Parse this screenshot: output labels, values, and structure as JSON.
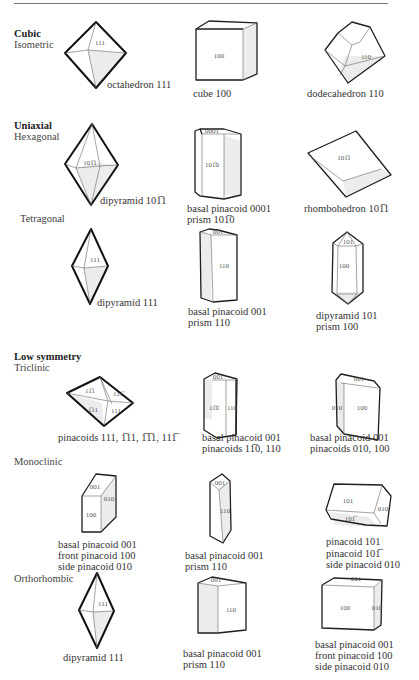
{
  "header": {
    "cut_title": ""
  },
  "sections": {
    "cubic": {
      "title": "Cubic",
      "subtitle": "Isometric",
      "forms": [
        {
          "face": "111",
          "caption": [
            "octahedron 111"
          ]
        },
        {
          "face": "100",
          "caption": [
            "cube 100"
          ]
        },
        {
          "face": "110",
          "caption": [
            "dodecahedron 110"
          ]
        }
      ]
    },
    "uniaxial": {
      "title": "Uniaxial",
      "hexagonal": {
        "subtitle": "Hexagonal",
        "forms": [
          {
            "face": "101̅1",
            "caption": [
              "dipyramid 101̅1"
            ]
          },
          {
            "faces": [
              "0001",
              "101̅0"
            ],
            "caption": [
              "basal pinacoid 0001",
              "prism 101̅0"
            ]
          },
          {
            "face": "101̅1",
            "caption": [
              "rhombohedron 101̅1"
            ]
          }
        ]
      },
      "tetragonal": {
        "subtitle": "Tetragonal",
        "forms": [
          {
            "face": "111",
            "caption": [
              "dipyramid 111"
            ]
          },
          {
            "faces": [
              "001",
              "110"
            ],
            "caption": [
              "basal pinacoid 001",
              "prism 110"
            ]
          },
          {
            "faces": [
              "101",
              "100"
            ],
            "caption": [
              "dipyramid 101",
              "prism 100"
            ]
          }
        ]
      }
    },
    "low_symmetry": {
      "title": "Low symmetry",
      "triclinic": {
        "subtitle": "Triclinic",
        "forms": [
          {
            "faces": [
              "11̅1",
              "111̅",
              "1̅11",
              "111"
            ],
            "caption": [
              "pinacoids 111, 1̅11, 1̅1̅1, 111̅"
            ]
          },
          {
            "faces": [
              "001",
              "11̅0",
              "110"
            ],
            "caption": [
              "basal pinacoid 001",
              "pinacoids 11̅0, 110"
            ]
          },
          {
            "faces": [
              "001",
              "010",
              "100"
            ],
            "caption": [
              "basal pinacoid 001",
              "pinacoids 010, 100"
            ]
          }
        ]
      },
      "monoclinic": {
        "subtitle": "Monoclinic",
        "forms": [
          {
            "faces": [
              "001",
              "010",
              "100"
            ],
            "caption": [
              "basal pinacoid 001",
              "front pinacoid 100",
              "side pinacoid 010"
            ]
          },
          {
            "faces": [
              "001",
              "110"
            ],
            "caption": [
              "basal pinacoid 001",
              "prism 110"
            ]
          },
          {
            "faces": [
              "101",
              "010",
              "101̅"
            ],
            "caption": [
              "pinacoid 101",
              "pinacoid 101̅",
              "side pinacoid 010"
            ]
          }
        ]
      },
      "orthorhombic": {
        "subtitle": "Orthorhombic",
        "forms": [
          {
            "face": "111",
            "caption": [
              "dipyramid 111"
            ]
          },
          {
            "faces": [
              "001",
              "110"
            ],
            "caption": [
              "basal pinacoid 001",
              "prism 110"
            ]
          },
          {
            "faces": [
              "001",
              "100",
              "010"
            ],
            "caption": [
              "basal pinacoid 001",
              "front pinacoid 100",
              "side pinacoid 010"
            ]
          }
        ]
      }
    }
  }
}
